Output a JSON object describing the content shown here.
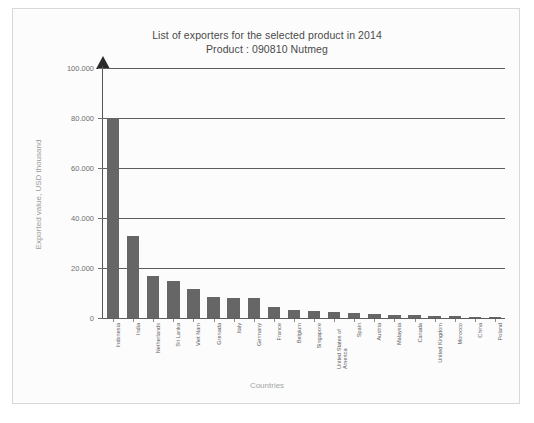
{
  "chart_data": {
    "type": "bar",
    "title": "List of exporters for the selected product in 2014",
    "subtitle": "Product : 090810 Nutmeg",
    "xlabel": "Countries",
    "ylabel": "Exported value, USD thousand",
    "ylim": [
      0,
      100000
    ],
    "grid": true,
    "legend": "none",
    "bar_color": "#666666",
    "ytick_labels": [
      "100.000",
      "80.000",
      "60.000",
      "40.000",
      "20.000",
      "0"
    ],
    "ytick_values": [
      100000,
      80000,
      60000,
      40000,
      20000,
      0
    ],
    "categories": [
      "Indonesia",
      "India",
      "Netherlands",
      "Sri Lanka",
      "Viet Nam",
      "Grenada",
      "Italy",
      "Germany",
      "France",
      "Belgium",
      "Singapore",
      "United States of America",
      "Spain",
      "Austria",
      "Malaysia",
      "Canada",
      "United Kingdom",
      "Morocco",
      "China",
      "Poland"
    ],
    "values": [
      80000,
      33000,
      16800,
      14700,
      11600,
      8300,
      8100,
      7900,
      4600,
      3300,
      3000,
      2300,
      2200,
      1500,
      1300,
      1100,
      900,
      800,
      600,
      400
    ]
  }
}
